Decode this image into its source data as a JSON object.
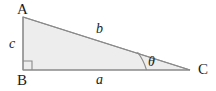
{
  "figure": {
    "kind": "right-triangle-geometry-diagram",
    "background_color": "#ffffff",
    "fill_color": "#ededed",
    "stroke_color": "#8a8a8a",
    "text_color": "#1c1c1c"
  },
  "vertices": {
    "a": {
      "label": "A",
      "x": 23,
      "y": 17
    },
    "b": {
      "label": "B",
      "x": 23,
      "y": 70
    },
    "c": {
      "label": "C",
      "x": 190,
      "y": 70
    }
  },
  "sides": {
    "vertical": {
      "label": "c",
      "from": "A",
      "to": "B"
    },
    "hypotenuse": {
      "label": "b",
      "from": "A",
      "to": "C"
    },
    "base": {
      "label": "a",
      "from": "B",
      "to": "C"
    }
  },
  "angles": {
    "at_c": {
      "label": "θ",
      "name": "theta"
    },
    "at_b": {
      "label": "",
      "name": "right-angle",
      "marker": "square"
    }
  }
}
